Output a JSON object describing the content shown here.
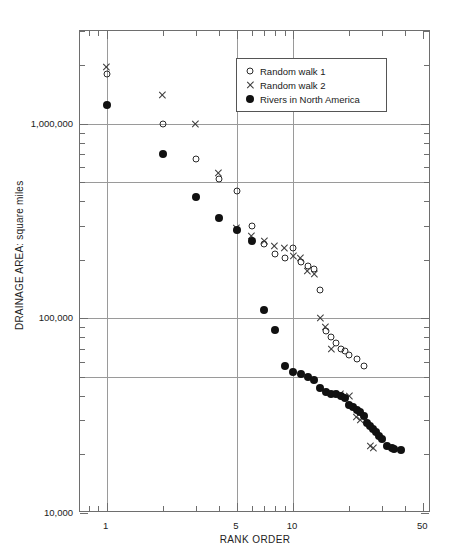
{
  "figure": {
    "background": "#ffffff",
    "width": 453,
    "height": 560
  },
  "axis": {
    "x_title": "RANK ORDER",
    "y_title": "DRAINAGE AREA:  square miles",
    "x_ticklabels": [
      "1",
      "5",
      "10",
      "50"
    ],
    "y_ticklabels": [
      "10,000",
      "100,000",
      "1,000,000"
    ]
  },
  "legend": {
    "position": "top-right-inside",
    "items": [
      {
        "label": "Random walk 1",
        "marker": "open-circle",
        "color": "#2a2a2a"
      },
      {
        "label": "Random walk 2",
        "marker": "cross",
        "color": "#3a3a3a"
      },
      {
        "label": "Rivers in North America",
        "marker": "filled-circle",
        "color": "#111111"
      }
    ]
  },
  "chart_data": {
    "type": "scatter",
    "title": "",
    "xlabel": "RANK ORDER",
    "ylabel": "DRAINAGE AREA:  square miles",
    "xscale": "log",
    "yscale": "log",
    "xlim": [
      0.72,
      55
    ],
    "ylim": [
      10000,
      3000000
    ],
    "xticks": [
      1,
      5,
      10,
      50
    ],
    "yticks": [
      10000,
      100000,
      1000000
    ],
    "grid": true,
    "gridlines_x": [
      1,
      5,
      10
    ],
    "gridlines_y": [
      50000,
      100000,
      500000,
      1000000
    ],
    "series": [
      {
        "name": "Random walk 1",
        "marker": "open-circle",
        "points": [
          [
            1,
            1800000
          ],
          [
            2,
            1000000
          ],
          [
            3,
            660000
          ],
          [
            4,
            520000
          ],
          [
            5,
            450000
          ],
          [
            6,
            300000
          ],
          [
            7,
            240000
          ],
          [
            8,
            215000
          ],
          [
            9,
            205000
          ],
          [
            10,
            230000
          ],
          [
            11,
            195000
          ],
          [
            12,
            185000
          ],
          [
            13,
            180000
          ],
          [
            14,
            140000
          ],
          [
            15,
            86000
          ],
          [
            16,
            80000
          ],
          [
            17,
            75000
          ],
          [
            18,
            70000
          ],
          [
            19,
            68000
          ],
          [
            20,
            65000
          ],
          [
            22,
            62000
          ],
          [
            24,
            57000
          ]
        ]
      },
      {
        "name": "Random walk 2",
        "marker": "cross",
        "points": [
          [
            1,
            1950000
          ],
          [
            2,
            1400000
          ],
          [
            3,
            1000000
          ],
          [
            4,
            560000
          ],
          [
            5,
            290000
          ],
          [
            6,
            265000
          ],
          [
            7,
            250000
          ],
          [
            8,
            235000
          ],
          [
            9,
            230000
          ],
          [
            10,
            210000
          ],
          [
            11,
            205000
          ],
          [
            12,
            175000
          ],
          [
            13,
            170000
          ],
          [
            14,
            100000
          ],
          [
            15,
            90000
          ],
          [
            16,
            70000
          ],
          [
            18,
            41000
          ],
          [
            20,
            40000
          ],
          [
            22,
            31000
          ],
          [
            23,
            30000
          ],
          [
            26,
            22000
          ],
          [
            27,
            21500
          ]
        ]
      },
      {
        "name": "Rivers in North America",
        "marker": "filled-circle",
        "points": [
          [
            1,
            1250000
          ],
          [
            2,
            700000
          ],
          [
            3,
            420000
          ],
          [
            4,
            330000
          ],
          [
            5,
            285000
          ],
          [
            6,
            250000
          ],
          [
            7,
            110000
          ],
          [
            8,
            87000
          ],
          [
            9,
            57000
          ],
          [
            10,
            53000
          ],
          [
            11,
            52000
          ],
          [
            12,
            50000
          ],
          [
            13,
            48000
          ],
          [
            14,
            44000
          ],
          [
            15,
            42000
          ],
          [
            16,
            41000
          ],
          [
            17,
            41000
          ],
          [
            18,
            40000
          ],
          [
            19,
            39000
          ],
          [
            20,
            36000
          ],
          [
            21,
            35000
          ],
          [
            22,
            34000
          ],
          [
            23,
            33000
          ],
          [
            24,
            31500
          ],
          [
            25,
            29000
          ],
          [
            26,
            28000
          ],
          [
            27,
            27000
          ],
          [
            28,
            26000
          ],
          [
            29,
            25000
          ],
          [
            30,
            24000
          ],
          [
            32,
            22000
          ],
          [
            34,
            21500
          ],
          [
            35,
            21400
          ],
          [
            38,
            21000
          ]
        ]
      }
    ]
  }
}
